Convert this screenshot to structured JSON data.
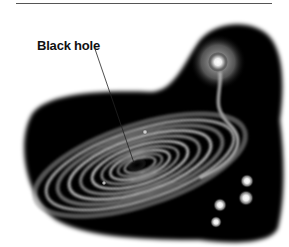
{
  "figure": {
    "labels": [
      {
        "text": "Black hole",
        "target": "black-hole-center"
      }
    ],
    "elements": [
      "accretion-disk",
      "black-hole-center",
      "companion-star",
      "gas-stream",
      "star-cluster"
    ],
    "colors": {
      "space": "#000000",
      "disk": "#cfcfcf",
      "background": "#ffffff"
    }
  }
}
